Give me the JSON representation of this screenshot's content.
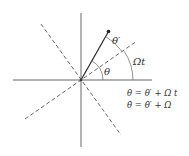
{
  "diagram": {
    "title": "",
    "colors": {
      "line": "#444444",
      "background": "#ffffff"
    },
    "labels": {
      "theta_prime": "θ′",
      "theta": "θ",
      "omega_t": "Ωt"
    },
    "equations": [
      "θ = θ′ + Ω t",
      "θ̇ = θ̇′ + Ω"
    ],
    "elements": {
      "axes": "horizontal and vertical solid axes crossing at origin",
      "rotating_axes": "two dashed perpendicular lines through origin, rotated by angle Ωt",
      "pendulum": "solid line from origin to bob at angle θ from horizontal, θ′ from rotating axis"
    }
  }
}
